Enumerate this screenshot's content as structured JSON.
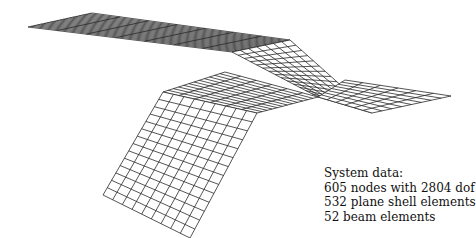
{
  "figure": {
    "mesh_color": "#2a2a2a",
    "background": "#ffffff"
  },
  "caption": {
    "title": "System data:",
    "lines": [
      "605 nodes with 2804 dof",
      "532 plane shell elements",
      "52 beam elements"
    ]
  },
  "mesh": {
    "patches": [
      {
        "name": "upper-plate",
        "corners": [
          [
            28,
            27
          ],
          [
            92,
            13
          ],
          [
            290,
            40
          ],
          [
            232,
            52
          ]
        ],
        "nu": 20,
        "nv": 7
      },
      {
        "name": "ramp-plate",
        "corners": [
          [
            232,
            52
          ],
          [
            290,
            40
          ],
          [
            372,
            113
          ],
          [
            318,
            97
          ]
        ],
        "nu": 7,
        "nv": 14
      },
      {
        "name": "middle-plate",
        "corners": [
          [
            163,
            92
          ],
          [
            225,
            72
          ],
          [
            318,
            97
          ],
          [
            257,
            113
          ]
        ],
        "nu": 12,
        "nv": 6
      },
      {
        "name": "lower-right-plate",
        "corners": [
          [
            318,
            97
          ],
          [
            345,
            80
          ],
          [
            451,
            96
          ],
          [
            372,
            113
          ]
        ],
        "nu": 8,
        "nv": 6
      },
      {
        "name": "hanging-wall",
        "corners": [
          [
            163,
            92
          ],
          [
            257,
            113
          ],
          [
            190,
            238
          ],
          [
            103,
            195
          ]
        ],
        "nu": 9,
        "nv": 14
      }
    ]
  }
}
